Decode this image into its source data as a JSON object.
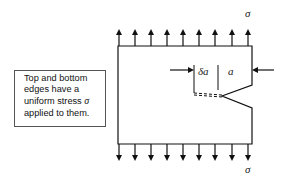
{
  "diagram": {
    "type": "fracture-mechanics-schematic",
    "labels": {
      "stress_top": "σ",
      "stress_bottom": "σ",
      "crack_increment": "δa",
      "crack_length": "a"
    },
    "note": {
      "lines": [
        "Top and bottom",
        "edges have a",
        "uniform stress ",
        "applied to them."
      ],
      "symbol": "σ"
    },
    "arrows": {
      "top_count": 9,
      "bottom_count": 9,
      "direction_top": "up",
      "direction_bottom": "down"
    },
    "colors": {
      "stroke": "#111111",
      "background": "#ffffff",
      "box_border": "#555555"
    }
  }
}
